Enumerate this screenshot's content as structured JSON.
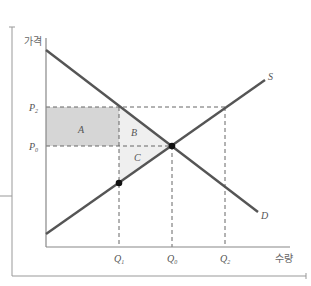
{
  "diagram": {
    "title": "",
    "y_axis_label": "가격",
    "x_axis_label": "수량",
    "curves": {
      "demand": {
        "label": "D",
        "from": [
          46,
          50
        ],
        "to": [
          258,
          212
        ]
      },
      "supply": {
        "label": "S",
        "from": [
          46,
          234
        ],
        "to": [
          265,
          80
        ]
      }
    },
    "price_levels": [
      {
        "label": "P",
        "sub": "2",
        "y": 107
      },
      {
        "label": "P",
        "sub": "0",
        "y": 146
      }
    ],
    "quantity_levels": [
      {
        "label": "Q",
        "sub": "1",
        "x": 119
      },
      {
        "label": "Q",
        "sub": "0",
        "x": 172
      },
      {
        "label": "Q",
        "sub": "2",
        "x": 225
      }
    ],
    "regions": [
      {
        "label": "A",
        "fill": "#d6d6d6"
      },
      {
        "label": "B",
        "fill": "#eeeeee"
      },
      {
        "label": "C",
        "fill": "#eeeeee"
      }
    ],
    "points": [
      {
        "name": "equilibrium",
        "x": 172,
        "y": 146
      },
      {
        "name": "supply-at-Q1",
        "x": 119,
        "y": 183
      }
    ],
    "colors": {
      "curve": "#555555",
      "axis": "#888888",
      "guide": "#666666"
    }
  }
}
